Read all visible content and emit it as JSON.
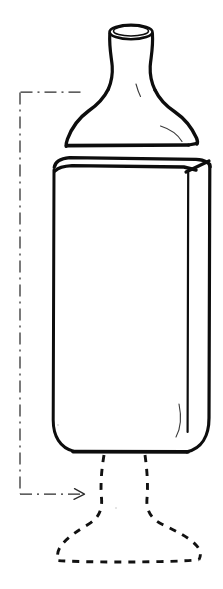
{
  "figure": {
    "kind": "technical-line-drawing",
    "subject_label": "bottle",
    "background_color": "#ffffff",
    "ink_color": "#0d0d0d",
    "leader_color": "#2b2b2b",
    "canvas": {
      "width": 223,
      "height": 589
    },
    "visible_text": "",
    "parts": [
      {
        "name": "bottle-lip",
        "style": "solid",
        "description": "elliptical rolled mouth ring at top of neck"
      },
      {
        "name": "bottle-neck",
        "style": "solid",
        "description": "short cylindrical neck tapering outward toward shoulder"
      },
      {
        "name": "bottle-shoulder",
        "style": "solid",
        "description": "wide concave flared shoulder ending in a flat ledge"
      },
      {
        "name": "bottle-body",
        "style": "solid",
        "description": "tall rectangular body in slight perspective with rounded lower corners"
      },
      {
        "name": "phantom-pedestal-foot",
        "style": "dashed",
        "description": "dashed hidden/alternate pedestal base below the body"
      },
      {
        "name": "leader-annotation",
        "style": "dash-dot",
        "description": "bracket-shaped dashed leader running down the left margin ending in an arrowhead pointing right at the phantom base"
      }
    ],
    "geometry": {
      "lip": {
        "cx": 131,
        "cy": 32,
        "rx": 21,
        "ry": 7
      },
      "neck": {
        "top_y": 32,
        "bottom_y": 96,
        "left_x": 112,
        "right_x": 150
      },
      "shoulder": {
        "ledge_y": 146,
        "left_x": 66,
        "right_x": 196
      },
      "body": {
        "top_y": 157,
        "bottom_y": 452,
        "left_x": 53,
        "right_x": 210,
        "inner_edge_x": 188
      },
      "foot": {
        "top_y": 455,
        "bottom_y": 561,
        "left_x": 57,
        "right_x": 201
      },
      "leader": {
        "x": 20,
        "top_y": 92,
        "bottom_y": 494,
        "arrow_tip_x": 84
      }
    },
    "stroke_widths": {
      "outline": 3.4,
      "body_side": 3.0,
      "phantom": 2.9,
      "leader": 1.2
    }
  }
}
